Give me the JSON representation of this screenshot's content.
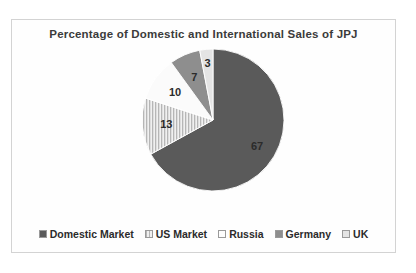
{
  "chart_data": {
    "type": "pie",
    "title": "Percentage of Domestic and International Sales of JPJ",
    "xlabel": "",
    "ylabel": "",
    "legend_position": "bottom",
    "grid": false,
    "categories": [
      "Domestic Market",
      "US Market",
      "Russia",
      "Germany",
      "UK"
    ],
    "values": [
      67,
      13,
      10,
      7,
      3
    ],
    "value_labels": [
      "67",
      "13",
      "10",
      "7",
      "3"
    ],
    "colors": [
      "#5a5a5a",
      "#d8d8d8",
      "#fbfbfb",
      "#8e8e8e",
      "#e4e4e4"
    ],
    "fills": [
      "solid",
      "vertical-stripes",
      "solid",
      "solid",
      "solid"
    ],
    "start_angle_deg": 0,
    "direction": "clockwise",
    "slices": [
      {
        "label": "Domestic Market",
        "value": 67,
        "value_label": "67",
        "color": "#5a5a5a",
        "fill": "solid"
      },
      {
        "label": "US Market",
        "value": 13,
        "value_label": "13",
        "color": "#d8d8d8",
        "fill": "vertical-stripes"
      },
      {
        "label": "Russia",
        "value": 10,
        "value_label": "10",
        "color": "#fbfbfb",
        "fill": "solid"
      },
      {
        "label": "Germany",
        "value": 7,
        "value_label": "7",
        "color": "#8e8e8e",
        "fill": "solid"
      },
      {
        "label": "UK",
        "value": 3,
        "value_label": "3",
        "color": "#e4e4e4",
        "fill": "solid"
      }
    ]
  },
  "legend": {
    "items": [
      {
        "label": "Domestic Market",
        "color": "#5a5a5a"
      },
      {
        "label": "US Market",
        "color": "#d8d8d8"
      },
      {
        "label": "Russia",
        "color": "#fdfdfd"
      },
      {
        "label": "Germany",
        "color": "#8e8e8e"
      },
      {
        "label": "UK",
        "color": "#e4e4e4"
      }
    ]
  }
}
